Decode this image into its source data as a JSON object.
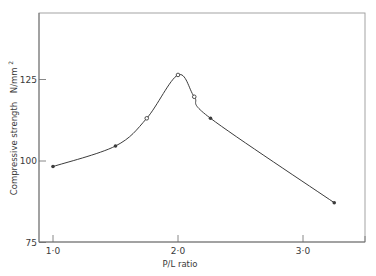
{
  "chart_data": {
    "type": "line",
    "title": "",
    "xlabel": "P/L ratio",
    "ylabel": "Compressive strength  N/mm²",
    "xlim": [
      0.9,
      3.5
    ],
    "ylim": [
      75,
      145
    ],
    "x_ticks": [
      1.0,
      2.0,
      3.0
    ],
    "x_tick_labels": [
      "1·0",
      "2·0",
      "3·0"
    ],
    "y_ticks": [
      75,
      100,
      125
    ],
    "y_tick_labels": [
      "75",
      "100",
      "125"
    ],
    "grid": false,
    "legend": null,
    "smooth": true,
    "series": [
      {
        "name": "Compressive strength",
        "x": [
          1.0,
          1.5,
          1.75,
          2.0,
          2.13,
          2.26,
          3.25
        ],
        "y": [
          98.3,
          104.6,
          113.1,
          126.4,
          119.7,
          113.1,
          87.2
        ],
        "markers": [
          "filled",
          "filled",
          "open",
          "open",
          "open",
          "filled",
          "filled"
        ]
      }
    ]
  },
  "axes": {
    "x_title": "P/L ratio",
    "y_title_main": "Compressive strength",
    "y_title_unit": "N/mm",
    "y_title_sup": "2"
  },
  "colors": {
    "line": "#3c3c3c",
    "frame": "#9a9a9a",
    "text": "#3a3a3a"
  }
}
